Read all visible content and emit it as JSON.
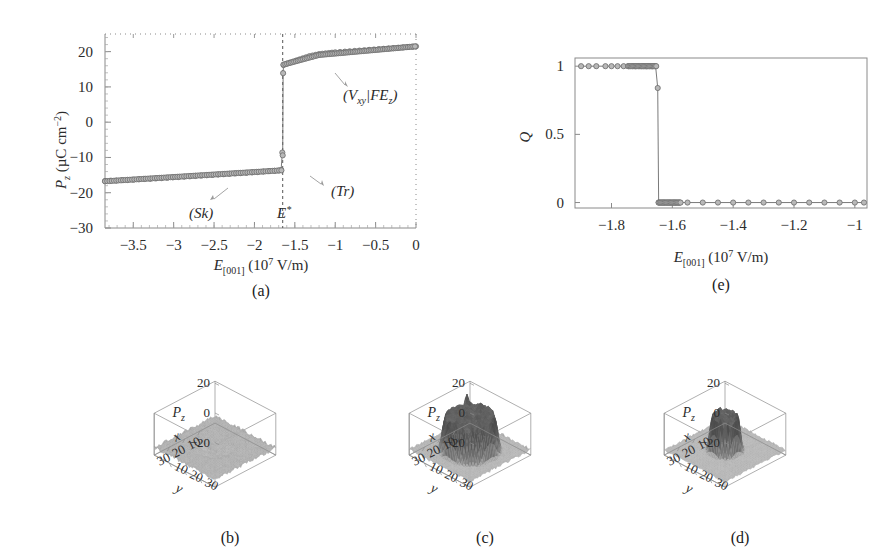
{
  "figure": {
    "caption_a": "(a)",
    "caption_b": "(b)",
    "caption_c": "(c)",
    "caption_d": "(d)",
    "caption_e": "(e)",
    "marker_fill": "#b8b8b8",
    "marker_stroke": "#6b6b6b",
    "axis_color": "#7a7a7a",
    "line_color": "#8a8a8a"
  },
  "panel_a": {
    "ylabel_main": "P",
    "ylabel_sub": "z",
    "ylabel_units": "(µC cm",
    "ylabel_units_sup": "−2",
    "ylabel_units_close": ")",
    "xlabel_main": "E",
    "xlabel_sub": "[001]",
    "xlabel_units": "(10",
    "xlabel_units_sup": "7",
    "xlabel_units_close": " V/m)",
    "xticks": [
      "−3.5",
      "−3",
      "−2.5",
      "−2",
      "−1.5",
      "−1",
      "−0.5",
      "0"
    ],
    "yticks": [
      "20",
      "10",
      "0",
      "−10",
      "−20",
      "−30"
    ],
    "annotations": {
      "sk": "(Sk)",
      "tr": "(Tr)",
      "estar_main": "E",
      "estar_sup": "*",
      "vxy_open": "(V",
      "vxy_sub": "xy",
      "vxy_bar": "|FE",
      "vxy_sub2": "z",
      "vxy_close": ")"
    }
  },
  "panel_e": {
    "ylabel": "Q",
    "xlabel_main": "E",
    "xlabel_sub": "[001]",
    "xlabel_units": "(10",
    "xlabel_units_sup": "7",
    "xlabel_units_close": " V/m)",
    "xticks": [
      "−1.8",
      "−1.6",
      "−1.4",
      "−1.2",
      "−1"
    ],
    "yticks": [
      "1",
      "0.5",
      "0"
    ]
  },
  "panel_3d": {
    "zlabel_main": "P",
    "zlabel_sub": "z",
    "zticks": [
      "20",
      "0",
      "−20"
    ],
    "xlabel": "x",
    "xticks": [
      "10",
      "20",
      "30"
    ],
    "ylabel": "y",
    "yticks": [
      "10",
      "20",
      "30"
    ]
  },
  "chart_data": [
    {
      "type": "scatter",
      "panel": "(a)",
      "title": "",
      "xlabel": "E_[001] (10^7 V/m)",
      "ylabel": "P_z (uC cm^-2)",
      "xlim": [
        -3.85,
        0.0
      ],
      "ylim": [
        -30,
        25
      ],
      "xticks": [
        -3.5,
        -3,
        -2.5,
        -2,
        -1.5,
        -1,
        -0.5,
        0
      ],
      "yticks": [
        20,
        10,
        0,
        -10,
        -20,
        -30
      ],
      "grid": false,
      "legend": null,
      "vertical_marker": {
        "label": "E*",
        "x": -1.65,
        "style": "dashed"
      },
      "annotations": [
        {
          "text": "(Sk)",
          "x": -2.05,
          "y": -25.5
        },
        {
          "text": "(Tr)",
          "x": -1.45,
          "y": -18.5
        },
        {
          "text": "(V_xy|FE_z)",
          "x": -1.22,
          "y": 8.0
        },
        {
          "text": "E*",
          "x": -1.72,
          "y": -25.5
        }
      ],
      "series": [
        {
          "name": "Sk branch",
          "x": [
            -3.85,
            -3.78,
            -3.71,
            -3.64,
            -3.57,
            -3.5,
            -3.43,
            -3.36,
            -3.29,
            -3.22,
            -3.15,
            -3.08,
            -3.01,
            -2.94,
            -2.87,
            -2.8,
            -2.73,
            -2.66,
            -2.59,
            -2.52,
            -2.45,
            -2.38,
            -2.31,
            -2.24,
            -2.17,
            -2.1,
            -2.03,
            -1.96,
            -1.89,
            -1.82,
            -1.75,
            -1.7,
            -1.67
          ],
          "y": [
            -16.7,
            -16.6,
            -16.55,
            -16.45,
            -16.4,
            -16.3,
            -16.2,
            -16.1,
            -16.05,
            -15.95,
            -15.85,
            -15.75,
            -15.65,
            -15.55,
            -15.45,
            -15.35,
            -15.25,
            -15.15,
            -15.05,
            -14.95,
            -14.85,
            -14.75,
            -14.65,
            -14.55,
            -14.45,
            -14.35,
            -14.25,
            -14.15,
            -14.0,
            -13.9,
            -13.8,
            -13.7,
            -13.6
          ]
        },
        {
          "name": "Tr points",
          "x": [
            -1.655,
            -1.65
          ],
          "y": [
            -8.6,
            -9.4
          ]
        },
        {
          "name": "V_xy|FE_z branch",
          "x": [
            -1.645,
            -1.64,
            -1.6,
            -1.56,
            -1.52,
            -1.48,
            -1.44,
            -1.4,
            -1.36,
            -1.32,
            -1.28,
            -1.24,
            -1.2,
            -1.16,
            -1.12,
            -1.08,
            -1.04,
            -1.0,
            -0.94,
            -0.88,
            -0.82,
            -0.76,
            -0.7,
            -0.64,
            -0.58,
            -0.52,
            -0.46,
            -0.4,
            -0.34,
            -0.28,
            -0.22,
            -0.16,
            -0.1,
            -0.04,
            0.0
          ],
          "y": [
            13.9,
            16.2,
            16.6,
            16.9,
            17.2,
            17.5,
            17.8,
            18.1,
            18.4,
            18.7,
            18.9,
            19.1,
            19.3,
            19.4,
            19.5,
            19.6,
            19.7,
            19.8,
            19.9,
            20.0,
            20.1,
            20.2,
            20.3,
            20.4,
            20.5,
            20.6,
            20.7,
            20.8,
            20.9,
            21.0,
            21.1,
            21.2,
            21.3,
            21.4,
            21.5
          ]
        }
      ]
    },
    {
      "type": "scatter",
      "panel": "(e)",
      "title": "",
      "xlabel": "E_[001] (10^7 V/m)",
      "ylabel": "Q",
      "xlim": [
        -1.92,
        -0.96
      ],
      "ylim": [
        -0.04,
        1.06
      ],
      "xticks": [
        -1.8,
        -1.6,
        -1.4,
        -1.2,
        -1
      ],
      "yticks": [
        0,
        0.5,
        1
      ],
      "grid": false,
      "legend": null,
      "series": [
        {
          "name": "Q upper branch",
          "x": [
            -1.9,
            -1.875,
            -1.85,
            -1.82,
            -1.8,
            -1.78,
            -1.76,
            -1.745,
            -1.73,
            -1.72,
            -1.71,
            -1.7,
            -1.695,
            -1.69,
            -1.685,
            -1.68,
            -1.675,
            -1.67,
            -1.665,
            -1.66,
            -1.655
          ],
          "y": [
            1,
            1,
            1,
            1,
            1,
            1,
            1,
            1,
            1,
            1,
            1,
            1,
            1,
            1,
            1,
            1,
            1,
            1,
            1,
            1,
            1
          ]
        },
        {
          "name": "Q transition",
          "x": [
            -1.648
          ],
          "y": [
            0.84
          ]
        },
        {
          "name": "Q lower branch",
          "x": [
            -1.645,
            -1.64,
            -1.635,
            -1.63,
            -1.625,
            -1.62,
            -1.615,
            -1.61,
            -1.605,
            -1.6,
            -1.595,
            -1.59,
            -1.585,
            -1.58,
            -1.575,
            -1.55,
            -1.5,
            -1.45,
            -1.4,
            -1.35,
            -1.3,
            -1.25,
            -1.2,
            -1.15,
            -1.1,
            -1.05,
            -1.0,
            -0.97
          ],
          "y": [
            0,
            0,
            0,
            0,
            0,
            0,
            0,
            0,
            0,
            0,
            0,
            0,
            0,
            0,
            0,
            0,
            0,
            0,
            0,
            0,
            0,
            0,
            0,
            0,
            0,
            0,
            0,
            0
          ]
        }
      ]
    },
    {
      "type": "surface",
      "panel": "(b)",
      "description": "3D surface of polarization P_z over a 40x40 x-y lattice; noisy flat background near -20 with a broad shallow circular depression in the centre (skyrmion state).",
      "xlabel": "x",
      "ylabel": "y",
      "zlabel": "P_z",
      "xticks": [
        10,
        20,
        30
      ],
      "yticks": [
        10,
        20,
        30
      ],
      "zticks": [
        -20,
        0,
        20
      ],
      "zlim": [
        -30,
        25
      ]
    },
    {
      "type": "surface",
      "panel": "(c)",
      "description": "3D surface of polarization P_z; noisy low background with a large raised central plateau reaching about +20 and a small isolated spike near the left edge (transitional state).",
      "xlabel": "x",
      "ylabel": "y",
      "zlabel": "P_z",
      "xticks": [
        10,
        20,
        30
      ],
      "yticks": [
        10,
        20,
        30
      ],
      "zticks": [
        -20,
        0,
        20
      ],
      "zlim": [
        -30,
        25
      ]
    },
    {
      "type": "surface",
      "panel": "(d)",
      "description": "3D surface of polarization P_z; noisy low background with a narrow, tall cylindrical column of positive polarization at the centre (vortex/FE state).",
      "xlabel": "x",
      "ylabel": "y",
      "zlabel": "P_z",
      "xticks": [
        10,
        20,
        30
      ],
      "yticks": [
        10,
        20,
        30
      ],
      "zticks": [
        -20,
        0,
        20
      ],
      "zlim": [
        -30,
        25
      ]
    }
  ]
}
